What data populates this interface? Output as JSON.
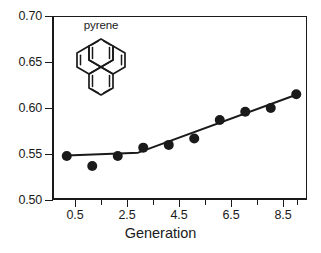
{
  "chart_data": {
    "type": "scatter",
    "title": "",
    "subtitle": "",
    "xlabel": "Generation",
    "ylabel": "",
    "xlim": [
      0,
      10
    ],
    "ylim": [
      0.5,
      0.7
    ],
    "grid": false,
    "legend": null,
    "x_ticks_major": [
      "0.5",
      "2.5",
      "4.5",
      "6.5",
      "8.5"
    ],
    "x_ticks_major_values": [
      0.5,
      2.5,
      4.5,
      6.5,
      8.5
    ],
    "x_ticks_minor_values": [
      1.5,
      3.5,
      5.5,
      7.5,
      9.5
    ],
    "y_ticks_major": [
      "0.50",
      "0.55",
      "0.60",
      "0.65",
      "0.70"
    ],
    "y_ticks_major_values": [
      0.5,
      0.55,
      0.6,
      0.65,
      0.7
    ],
    "x": [
      0.5,
      1.5,
      2.5,
      3.5,
      4.5,
      5.5,
      6.5,
      7.5,
      8.5,
      9.5
    ],
    "values": [
      0.549,
      0.538,
      0.549,
      0.558,
      0.561,
      0.568,
      0.588,
      0.597,
      0.601,
      0.616
    ],
    "series": [
      {
        "name": "pyrene",
        "marker": "filled-circle",
        "color": "#1a1a1a",
        "x": [
          0.5,
          1.5,
          2.5,
          3.5,
          4.5,
          5.5,
          6.5,
          7.5,
          8.5,
          9.5
        ],
        "values": [
          0.549,
          0.538,
          0.549,
          0.558,
          0.561,
          0.568,
          0.588,
          0.597,
          0.601,
          0.616
        ]
      }
    ],
    "fit_line": {
      "name": "piecewise-linear-fit",
      "color": "#1a1a1a",
      "x": [
        0.5,
        3.3,
        9.5
      ],
      "values": [
        0.5495,
        0.5525,
        0.6155
      ]
    },
    "annotations": [
      {
        "name": "pyrene",
        "label": "pyrene",
        "kind": "molecular-structure",
        "structure": "four-fused-benzene-rings"
      }
    ]
  },
  "axes": {
    "x_title": "Generation",
    "x_tick_labels": [
      "0.5",
      "2.5",
      "4.5",
      "6.5",
      "8.5"
    ],
    "y_tick_labels": [
      "0.70",
      "0.65",
      "0.60",
      "0.55",
      "0.50"
    ]
  },
  "annotation": {
    "label": "pyrene"
  },
  "colors": {
    "axis": "#1a1a1a",
    "marker": "#1a1a1a",
    "line": "#1a1a1a",
    "background": "#ffffff"
  }
}
